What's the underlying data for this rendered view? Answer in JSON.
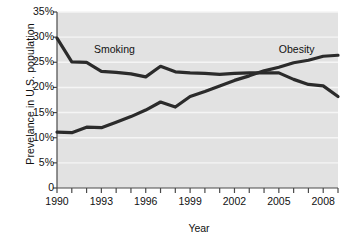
{
  "chart_data": {
    "type": "line",
    "title": "",
    "xlabel": "Year",
    "ylabel": "Prevelance in U.S. population",
    "xlim": [
      1990,
      2009
    ],
    "ylim": [
      0,
      35
    ],
    "ytick_values": [
      0,
      5,
      10,
      15,
      20,
      25,
      30,
      35
    ],
    "ytick_labels": [
      "0",
      "5%",
      "10%",
      "15%",
      "20%",
      "25%",
      "30%",
      "35%"
    ],
    "xtick_values": [
      1990,
      1993,
      1996,
      1999,
      2002,
      2005,
      2008
    ],
    "xtick_labels": [
      "1990",
      "1993",
      "1996",
      "1999",
      "2002",
      "2005",
      "2008"
    ],
    "xtick_minor_values": [
      1990,
      1991,
      1992,
      1993,
      1994,
      1995,
      1996,
      1997,
      1998,
      1999,
      2000,
      2001,
      2002,
      2003,
      2004,
      2005,
      2006,
      2007,
      2008,
      2009
    ],
    "grid": "horizontal",
    "grid_color": "#f5f5f5",
    "plot_background": "#e2e2e2",
    "legend_position": "inline-annotations",
    "x": [
      1990,
      1991,
      1992,
      1993,
      1994,
      1995,
      1996,
      1997,
      1998,
      1999,
      2000,
      2001,
      2002,
      2003,
      2004,
      2005,
      2006,
      2007,
      2008,
      2009
    ],
    "series": [
      {
        "name": "Smoking",
        "color": "#2b2b2b",
        "values": [
          29.8,
          25.1,
          25.0,
          23.2,
          23.0,
          22.7,
          22.1,
          24.2,
          23.1,
          22.9,
          22.8,
          22.6,
          22.8,
          22.9,
          22.9,
          22.9,
          21.6,
          20.6,
          20.3,
          18.2
        ]
      },
      {
        "name": "Obesity",
        "color": "#2b2b2b",
        "values": [
          11.1,
          11.0,
          12.1,
          12.0,
          13.1,
          14.2,
          15.5,
          17.1,
          16.1,
          18.2,
          19.2,
          20.3,
          21.4,
          22.3,
          23.3,
          24.0,
          24.9,
          25.4,
          26.2,
          26.4
        ]
      }
    ],
    "annotations": [
      {
        "text": "Smoking",
        "x": 1992.5,
        "y": 27.6
      },
      {
        "text": "Obesity",
        "x": 2005.0,
        "y": 27.6
      }
    ]
  }
}
